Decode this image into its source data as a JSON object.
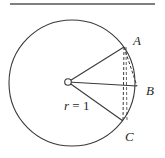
{
  "diagram": {
    "type": "geometry",
    "colors": {
      "stroke": "#3a3a3a",
      "background": "#ffffff"
    },
    "labels": {
      "A": "A",
      "B": "B",
      "C": "C",
      "radius_var": "r",
      "radius_eq": " = 1"
    },
    "points": {
      "center": [
        68,
        82
      ],
      "A": [
        124,
        47
      ],
      "B": [
        137,
        86
      ],
      "C": [
        123,
        121
      ]
    },
    "circle": {
      "cx": 72,
      "cy": 83,
      "r": 63
    }
  }
}
